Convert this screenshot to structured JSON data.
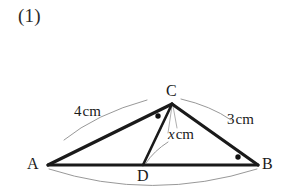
{
  "page": {
    "problem_number": "(1)",
    "background_color": "#ffffff",
    "ink_color": "#1a1a1a",
    "thin_line_color": "#8a8a8a"
  },
  "figure": {
    "vertices": [
      {
        "id": "A",
        "label": "A",
        "x": 48,
        "y": 165,
        "label_x": 27,
        "label_y": 156
      },
      {
        "id": "B",
        "label": "B",
        "x": 258,
        "y": 165,
        "label_x": 262,
        "label_y": 156
      },
      {
        "id": "C",
        "label": "C",
        "x": 172,
        "y": 104,
        "label_x": 166,
        "label_y": 83
      },
      {
        "id": "D",
        "label": "D",
        "x": 143,
        "y": 165,
        "label_x": 137,
        "label_y": 168
      }
    ],
    "segments": [
      {
        "name": "side-ac",
        "from": "A",
        "to": "C",
        "weight": "thick"
      },
      {
        "name": "side-cb",
        "from": "C",
        "to": "B",
        "weight": "thick"
      },
      {
        "name": "side-ab",
        "from": "A",
        "to": "B",
        "weight": "thick"
      },
      {
        "name": "cevian-cd",
        "from": "C",
        "to": "D",
        "weight": "thick"
      }
    ],
    "angle_marks": [
      {
        "name": "angle-mark-acd",
        "x": 158,
        "y": 116,
        "r": 2.6
      },
      {
        "name": "angle-mark-abc",
        "x": 238,
        "y": 157,
        "r": 2.6
      }
    ],
    "labels": [
      {
        "name": "length-ac",
        "value": "4",
        "unit": "cm",
        "italic": false,
        "x": 74,
        "y": 103
      },
      {
        "name": "length-cb",
        "value": "3",
        "unit": "cm",
        "italic": false,
        "x": 227,
        "y": 111
      },
      {
        "name": "length-cd",
        "value": "x",
        "unit": "cm",
        "italic": true,
        "x": 168,
        "y": 126
      }
    ],
    "leader_curves": [
      {
        "name": "leader-curve-ac",
        "d": "M 64 140 Q 96 114 147 100"
      },
      {
        "name": "leader-curve-cb",
        "d": "M 230 121 Q 210 106 180 99"
      },
      {
        "name": "leader-curve-cd",
        "d": "M 167 143 Q 153 152 146 163"
      },
      {
        "name": "leader-curve-ab",
        "d": "M 50 169 Q 150 200 256 169"
      }
    ]
  }
}
